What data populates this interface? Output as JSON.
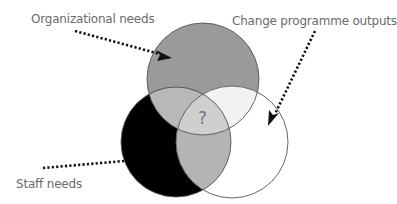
{
  "diagram": {
    "type": "venn",
    "labels": {
      "organizational": "Organizational needs",
      "change": "Change programme outputs",
      "staff": "Staff needs",
      "center": "?"
    },
    "circles": [
      {
        "id": "organizational",
        "cx": 203,
        "cy": 79,
        "r": 56,
        "fill": "#9a9a9a"
      },
      {
        "id": "staff",
        "cx": 176,
        "cy": 142,
        "r": 55,
        "fill": "#000000"
      },
      {
        "id": "change",
        "cx": 232,
        "cy": 142,
        "r": 56,
        "fill": "#ffffff"
      }
    ],
    "colors": {
      "org_only": "#9a9a9a",
      "staff_only": "#000000",
      "change_only": "#ffffff",
      "org_staff": "#b8b8b8",
      "org_change": "#f2f2f2",
      "staff_change": "#b4b4b4",
      "all_three": "#cfcfcf",
      "outline": "#555555",
      "text": "#6b6b6b",
      "arrow": "#111111"
    }
  }
}
